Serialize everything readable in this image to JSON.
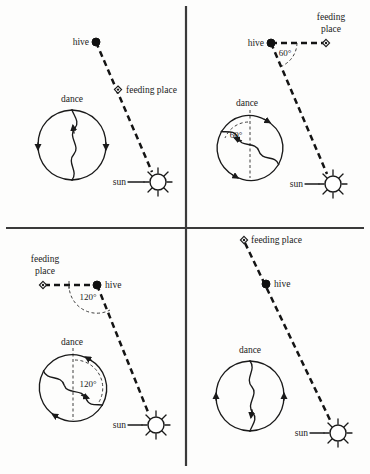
{
  "figure": {
    "background_color": "#fdfdfc",
    "ink_color": "#1a1a1a",
    "width": 370,
    "height": 474
  },
  "labels": {
    "hive": "hive",
    "feeding_place": "feeding place",
    "feeding_line1": "feeding",
    "feeding_line2": "place",
    "dance": "dance",
    "sun": "sun"
  },
  "panels": [
    {
      "id": "top-left",
      "position": "top-left",
      "angle_label": null,
      "angle_degrees": 0,
      "description": "Feeding place lies directly toward the sun; waggle run points straight up.",
      "markers": {
        "hive": "hive",
        "feeding_place": "feeding place",
        "sun": "sun",
        "dance": "dance"
      }
    },
    {
      "id": "top-right",
      "position": "top-right",
      "angle_label": "60°",
      "angle_degrees": 60,
      "description": "Feeding place lies 60° left of the sun; waggle run tilts 60° left of vertical.",
      "markers": {
        "hive": "hive",
        "feeding_place": "feeding place",
        "sun": "sun",
        "dance": "dance"
      }
    },
    {
      "id": "bottom-left",
      "position": "bottom-left",
      "angle_label": "120°",
      "angle_degrees": 120,
      "description": "Feeding place lies 120° from the sun; waggle run tilts 120° from vertical.",
      "markers": {
        "hive": "hive",
        "feeding_place": "feeding place",
        "sun": "sun",
        "dance": "dance"
      }
    },
    {
      "id": "bottom-right",
      "position": "bottom-right",
      "angle_label": null,
      "angle_degrees": 180,
      "description": "Feeding place lies directly away from the sun; waggle run points straight down.",
      "markers": {
        "hive": "hive",
        "feeding_place": "feeding place",
        "sun": "sun",
        "dance": "dance"
      }
    }
  ],
  "icons": {
    "hive": "filled-dot-icon",
    "feeding_place": "diamond-marker-icon",
    "sun": "sun-icon",
    "dance": "figure-eight-icon"
  }
}
